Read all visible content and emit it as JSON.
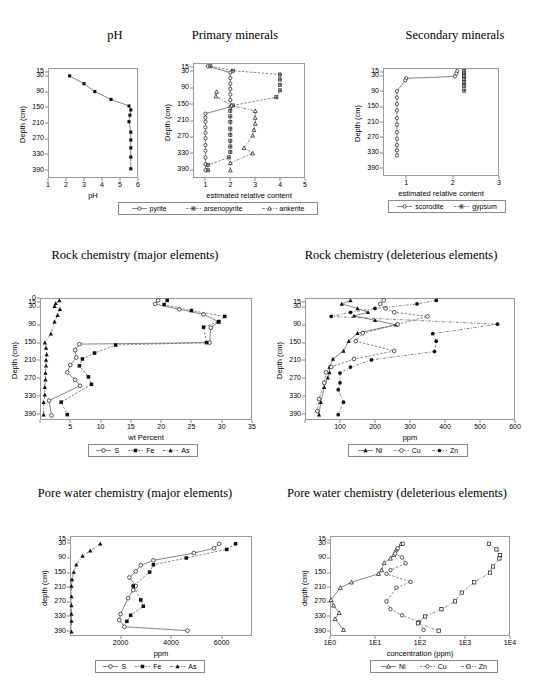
{
  "figure": {
    "panels": [
      {
        "id": "ph",
        "title": "pH",
        "ylabel": "Depth (cm)",
        "xlabel": "pH"
      },
      {
        "id": "primary-minerals",
        "title": "Primary minerals",
        "ylabel": "Depth (cm)",
        "xlabel": "estimated relative content"
      },
      {
        "id": "secondary-minerals",
        "title": "Secondary minerals",
        "ylabel": "Depth (cm)",
        "xlabel": "estimated relative content"
      },
      {
        "id": "rock-major",
        "title": "Rock chemistry (major elements)",
        "ylabel": "Depth (cm)",
        "xlabel": "wt Percent"
      },
      {
        "id": "rock-deleterious",
        "title": "Rock chemistry (deleterious elements)",
        "ylabel": "Depth (cm)",
        "xlabel": "ppm"
      },
      {
        "id": "porewater-major",
        "title": "Pore water chemistry (major elements)",
        "ylabel": "depth (cm)",
        "xlabel": "ppm"
      },
      {
        "id": "porewater-deleterious",
        "title": "Pore water chemistry (deleterious elements)",
        "ylabel": "depth (cm)",
        "xlabel": "concentration (ppm)"
      }
    ]
  },
  "chart_data": [
    {
      "id": "ph",
      "type": "line",
      "title": "pH",
      "xlabel": "pH",
      "ylabel": "Depth (cm)",
      "xlim": [
        1,
        6
      ],
      "xticks": [
        1,
        2,
        3,
        4,
        5,
        6
      ],
      "yticks": [
        15,
        30,
        90,
        150,
        210,
        270,
        330,
        390
      ],
      "ylim": [
        0,
        420
      ],
      "grid": false,
      "legend": null,
      "series": [
        {
          "name": "pH",
          "marker": "filled-square",
          "x": [
            2.2,
            3.0,
            3.6,
            4.5,
            5.5,
            5.6,
            5.55,
            5.5,
            5.6,
            5.6,
            5.6,
            5.6,
            5.6
          ],
          "depth": [
            30,
            60,
            90,
            120,
            145,
            160,
            180,
            205,
            245,
            275,
            305,
            340,
            385
          ]
        }
      ]
    },
    {
      "id": "primary-minerals",
      "type": "line",
      "title": "Primary minerals",
      "xlabel": "estimated relative content",
      "ylabel": "Depth (cm)",
      "xlim": [
        0.5,
        5
      ],
      "xticks": [
        1,
        2,
        3,
        4,
        5
      ],
      "yticks": [
        15,
        30,
        90,
        150,
        210,
        270,
        330,
        390
      ],
      "ylim": [
        0,
        420
      ],
      "grid": false,
      "legend": [
        "pyrite",
        "arsenopyrite",
        "ankerite"
      ],
      "series": [
        {
          "name": "pyrite",
          "marker": "open-circle",
          "x": [
            1.1,
            2.0,
            2.0,
            2.0,
            2.0,
            2.0,
            2.0,
            2.0,
            1.0,
            1.0,
            1.0,
            1.0,
            1.0,
            1.0,
            1.0,
            1.0,
            1.0,
            1.0,
            1.0
          ],
          "depth": [
            12,
            35,
            55,
            75,
            95,
            115,
            135,
            160,
            185,
            200,
            215,
            235,
            255,
            275,
            300,
            320,
            345,
            370,
            392
          ]
        },
        {
          "name": "arsenopyrite",
          "marker": "plus-square",
          "x": [
            1.2,
            2.1,
            4.0,
            4.0,
            4.0,
            4.0,
            3.85,
            2.1,
            2.0,
            2.0,
            2.0,
            2.0,
            2.0,
            2.0,
            2.0,
            2.0,
            1.95,
            1.1,
            1.1
          ],
          "depth": [
            12,
            28,
            42,
            60,
            80,
            100,
            125,
            155,
            175,
            195,
            215,
            240,
            262,
            285,
            305,
            325,
            345,
            372,
            392
          ]
        },
        {
          "name": "ankerite",
          "marker": "open-triangle",
          "x": [
            1.45,
            1.42,
            2.05,
            3.0,
            3.0,
            3.0,
            2.95,
            2.9,
            2.55,
            2.9,
            2.0,
            2.0
          ],
          "depth": [
            105,
            122,
            155,
            175,
            200,
            222,
            245,
            265,
            310,
            330,
            365,
            392
          ]
        }
      ]
    },
    {
      "id": "secondary-minerals",
      "type": "line",
      "title": "Secondary minerals",
      "xlabel": "estimated relative content",
      "ylabel": "Depth (cm)",
      "xlim": [
        0.5,
        3
      ],
      "xticks": [
        1,
        2,
        3
      ],
      "yticks": [
        15,
        30,
        90,
        150,
        210,
        270,
        330,
        390
      ],
      "ylim": [
        0,
        420
      ],
      "grid": false,
      "legend": [
        "scorodite",
        "gypsum"
      ],
      "series": [
        {
          "name": "scorodite",
          "marker": "open-circle",
          "x": [
            2.1,
            2.08,
            2.05,
            1.0,
            0.98,
            0.8,
            0.8,
            0.8,
            0.8,
            0.8,
            0.8,
            0.8,
            0.8,
            0.8,
            0.8,
            0.8
          ],
          "depth": [
            12,
            22,
            33,
            40,
            48,
            90,
            115,
            140,
            165,
            195,
            220,
            250,
            275,
            300,
            320,
            340
          ]
        },
        {
          "name": "gypsum",
          "marker": "plus-square",
          "x": [
            2.25,
            2.25,
            2.25,
            2.25,
            2.25,
            2.25,
            2.25
          ],
          "depth": [
            12,
            22,
            32,
            42,
            55,
            70,
            88
          ]
        }
      ]
    },
    {
      "id": "rock-major",
      "type": "line",
      "title": "Rock chemistry (major elements)",
      "xlabel": "wt Percent",
      "ylabel": "Depth (cm)",
      "xlim": [
        0,
        35
      ],
      "xticks": [
        0,
        5,
        10,
        15,
        20,
        25,
        30,
        35
      ],
      "xticklabels": [
        "",
        "5",
        "10",
        "15",
        "20",
        "25",
        "30",
        "35"
      ],
      "yticks": [
        0,
        15,
        30,
        90,
        150,
        210,
        270,
        330,
        390
      ],
      "ylim": [
        0,
        410
      ],
      "grid": false,
      "legend": [
        "S",
        "Fe",
        "As"
      ],
      "series": [
        {
          "name": "S",
          "marker": "open-circle",
          "x": [
            19.5,
            19.0,
            23.0,
            27.0,
            29.5,
            28.2,
            28.0,
            6.5,
            5.8,
            6.0,
            5.0,
            4.5,
            5.8,
            6.6,
            1.5,
            1.9
          ],
          "depth": [
            8,
            20,
            38,
            55,
            80,
            100,
            150,
            155,
            175,
            200,
            225,
            250,
            275,
            295,
            345,
            395
          ]
        },
        {
          "name": "Fe",
          "marker": "filled-square",
          "x": [
            21.0,
            20.5,
            25.0,
            30.5,
            29.5,
            27.0,
            27.5,
            12.5,
            9.0,
            7.0,
            6.5,
            8.0,
            8.5,
            3.5,
            4.5
          ],
          "depth": [
            8,
            22,
            42,
            62,
            80,
            98,
            150,
            158,
            185,
            205,
            228,
            265,
            290,
            350,
            392
          ]
        },
        {
          "name": "As",
          "marker": "filled-triangle",
          "x": [
            3.2,
            2.6,
            2.4,
            3.3,
            2.9,
            2.4,
            1.8,
            0.8,
            1.0,
            1.1,
            1.0,
            1.0,
            0.9,
            0.9,
            0.8,
            0.8,
            0.6,
            0.6
          ],
          "depth": [
            8,
            18,
            28,
            38,
            58,
            80,
            120,
            150,
            168,
            190,
            208,
            228,
            252,
            275,
            300,
            325,
            350,
            392
          ]
        }
      ]
    },
    {
      "id": "rock-deleterious",
      "type": "line",
      "title": "Rock chemistry (deleterious elements)",
      "xlabel": "ppm",
      "ylabel": "Depth (cm)",
      "xlim": [
        0,
        600
      ],
      "xticks": [
        0,
        100,
        200,
        300,
        400,
        500,
        600
      ],
      "xticklabels": [
        "",
        "100",
        "200",
        "300",
        "400",
        "500",
        "600"
      ],
      "yticks": [
        15,
        30,
        90,
        150,
        210,
        270,
        330,
        390
      ],
      "ylim": [
        0,
        410
      ],
      "grid": false,
      "legend": [
        "Ni",
        "Cu",
        "Zn"
      ],
      "series": [
        {
          "name": "Ni",
          "marker": "filled-triangle",
          "x": [
            130,
            105,
            150,
            180,
            140,
            200,
            260,
            150,
            125,
            110,
            80,
            70,
            70,
            65,
            55,
            45,
            40
          ],
          "depth": [
            8,
            20,
            35,
            48,
            60,
            75,
            90,
            118,
            145,
            178,
            205,
            232,
            250,
            268,
            300,
            350,
            392
          ]
        },
        {
          "name": "Cu",
          "marker": "open-circle",
          "x": [
            225,
            215,
            230,
            255,
            350,
            265,
            165,
            145,
            255,
            140,
            75,
            60,
            55,
            40,
            35
          ],
          "depth": [
            8,
            20,
            35,
            48,
            62,
            88,
            118,
            145,
            178,
            205,
            232,
            250,
            285,
            340,
            380
          ]
        },
        {
          "name": "Zn",
          "marker": "filled-circle",
          "x": [
            375,
            320,
            200,
            130,
            75,
            550,
            365,
            375,
            370,
            190,
            130,
            100,
            100,
            95,
            110,
            95
          ],
          "depth": [
            8,
            20,
            35,
            48,
            62,
            88,
            120,
            145,
            180,
            208,
            232,
            252,
            285,
            308,
            350,
            392
          ]
        }
      ]
    },
    {
      "id": "porewater-major",
      "type": "line",
      "title": "Pore water chemistry (major elements)",
      "xlabel": "ppm",
      "ylabel": "depth (cm)",
      "xlim": [
        0,
        7200
      ],
      "xticks": [
        2000,
        4000,
        6000
      ],
      "yticks": [
        15,
        30,
        90,
        150,
        210,
        270,
        330,
        390
      ],
      "ylim": [
        0,
        410
      ],
      "grid": false,
      "legend": [
        "S",
        "Fe",
        "As"
      ],
      "series": [
        {
          "name": "S",
          "marker": "open-circle",
          "x": [
            5900,
            5700,
            4900,
            3300,
            2800,
            2600,
            2350,
            2600,
            2500,
            2300,
            2000,
            1950,
            2150,
            4650
          ],
          "depth": [
            32,
            50,
            70,
            100,
            120,
            145,
            170,
            205,
            222,
            255,
            320,
            345,
            372,
            388
          ]
        },
        {
          "name": "Fe",
          "marker": "filled-square",
          "x": [
            6550,
            6200,
            4600,
            3300,
            3150,
            2500,
            2800,
            2900,
            2400,
            2250
          ],
          "depth": [
            32,
            55,
            90,
            118,
            148,
            205,
            262,
            288,
            325,
            350
          ]
        },
        {
          "name": "As",
          "marker": "filled-triangle",
          "x": [
            1200,
            800,
            500,
            250,
            150,
            80,
            60,
            60,
            60,
            60,
            60,
            60
          ],
          "depth": [
            32,
            60,
            82,
            118,
            148,
            178,
            205,
            248,
            285,
            320,
            348,
            392
          ]
        }
      ]
    },
    {
      "id": "porewater-deleterious",
      "type": "line",
      "title": "Pore water chemistry (deleterious elements)",
      "xlabel": "concentration (ppm)",
      "ylabel": "depth (cm)",
      "xscale": "log",
      "xlim": [
        1,
        10000
      ],
      "xticks": [
        1,
        10,
        100,
        1000,
        10000
      ],
      "xticklabels": [
        "1E0",
        "1E1",
        "1E2",
        "1E3",
        "1E4"
      ],
      "yticks": [
        15,
        30,
        90,
        150,
        210,
        270,
        330,
        390
      ],
      "ylim": [
        0,
        410
      ],
      "grid": false,
      "legend": [
        "Ni",
        "Cu",
        "Zn"
      ],
      "series": [
        {
          "name": "Ni",
          "marker": "open-triangle",
          "x": [
            38,
            30,
            26,
            22,
            16,
            14,
            12,
            3,
            1.7,
            1.05,
            1.2,
            1.6,
            1.3,
            2.0
          ],
          "depth": [
            32,
            55,
            78,
            92,
            110,
            140,
            155,
            190,
            212,
            262,
            285,
            315,
            340,
            385
          ]
        },
        {
          "name": "Cu",
          "marker": "open-circle",
          "x": [
            42,
            32,
            28,
            40,
            48,
            22,
            18,
            62,
            30,
            18,
            22,
            40,
            95,
            120
          ],
          "depth": [
            32,
            50,
            72,
            88,
            112,
            140,
            155,
            188,
            212,
            268,
            300,
            325,
            352,
            385
          ]
        },
        {
          "name": "Zn",
          "marker": "open-square",
          "x": [
            3400,
            5000,
            6000,
            5800,
            4200,
            3600,
            1600,
            850,
            600,
            300,
            130,
            90,
            260
          ],
          "depth": [
            32,
            55,
            78,
            92,
            125,
            150,
            190,
            232,
            268,
            300,
            330,
            358,
            388
          ]
        }
      ]
    }
  ]
}
